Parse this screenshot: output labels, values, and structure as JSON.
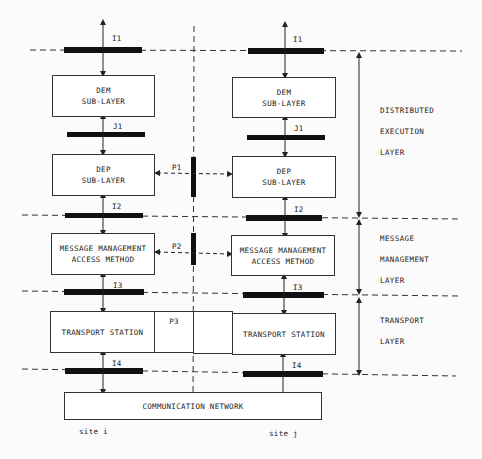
{
  "diagram": {
    "site_i": {
      "label": "site i",
      "dem": [
        "DEM",
        "SUB-LAYER"
      ],
      "dep": [
        "DEP",
        "SUB-LAYER"
      ],
      "mmam": [
        "MESSAGE MANAGEMENT",
        "ACCESS METHOD"
      ],
      "transport": "TRANSPORT STATION"
    },
    "site_j": {
      "label": "site j",
      "dem": [
        "DEM",
        "SUB-LAYER"
      ],
      "dep": [
        "DEP",
        "SUB-LAYER"
      ],
      "mmam": [
        "MESSAGE MANAGEMENT",
        "ACCESS METHOD"
      ],
      "transport": "TRANSPORT STATION"
    },
    "interfaces": {
      "i1": "I1",
      "j1": "J1",
      "i2": "I2",
      "i3": "I3",
      "i4": "I4"
    },
    "protocols": {
      "p1": "P1",
      "p2": "P2",
      "p3": "P3"
    },
    "network": "COMMUNICATION NETWORK",
    "layers": {
      "distributed_execution": [
        "DISTRIBUTED",
        "EXECUTION",
        "LAYER"
      ],
      "message_management": [
        "MESSAGE",
        "MANAGEMENT",
        "LAYER"
      ],
      "transport": [
        "TRANSPORT",
        "LAYER"
      ]
    }
  }
}
